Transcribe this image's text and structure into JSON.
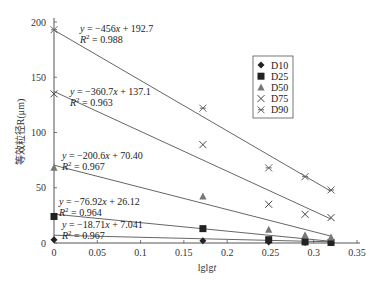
{
  "chart_data": {
    "type": "scatter",
    "title": "",
    "xlabel": "lglgt",
    "ylabel": "等效粒径R(μm)",
    "xlim": [
      0,
      0.35
    ],
    "ylim": [
      0,
      200
    ],
    "xticks": [
      0,
      0.05,
      0.1,
      0.15,
      0.2,
      0.25,
      0.3,
      0.35
    ],
    "xtick_labels": [
      "0",
      "0.05",
      "0.1",
      "0.15",
      "0.2",
      "0.25",
      "0.3",
      "0.35"
    ],
    "yticks": [
      0,
      50,
      100,
      150,
      200
    ],
    "ytick_labels": [
      "0",
      "50",
      "100",
      "150",
      "200"
    ],
    "grid": false,
    "legend_position": "upper right (inside)",
    "x": [
      0,
      0.172,
      0.248,
      0.29,
      0.32
    ],
    "series": [
      {
        "name": "D10",
        "marker": "diamond",
        "values": [
          3,
          2,
          1,
          0.5,
          0.3
        ],
        "fit": {
          "slope": -18.71,
          "intercept": 7.041,
          "equation": "y = −18.71x + 7.041",
          "r2": "R² = 0.967"
        }
      },
      {
        "name": "D25",
        "marker": "square",
        "values": [
          24,
          13,
          3,
          1,
          0.5
        ],
        "fit": {
          "slope": -76.92,
          "intercept": 26.12,
          "equation": "y = −76.92x + 26.12",
          "r2": "R² = 0.964"
        }
      },
      {
        "name": "D50",
        "marker": "triangle",
        "values": [
          68,
          42,
          12,
          7,
          5
        ],
        "fit": {
          "slope": -200.6,
          "intercept": 70.4,
          "equation": "y = −200.6x + 70.40",
          "r2": "R² = 0.967"
        }
      },
      {
        "name": "D75",
        "marker": "x",
        "values": [
          135,
          89,
          35,
          26,
          23
        ],
        "fit": {
          "slope": -360.7,
          "intercept": 137.1,
          "equation": "y = −360.7x + 137.1",
          "r2": "R² = 0.963"
        }
      },
      {
        "name": "D90",
        "marker": "star",
        "values": [
          193,
          122,
          68,
          60,
          48
        ],
        "fit": {
          "slope": -456,
          "intercept": 192.7,
          "equation": "y = −456x + 192.7",
          "r2": "R² = 0.988"
        }
      }
    ],
    "annotations": [
      {
        "series": "D90",
        "line1": "y = −456x + 192.7",
        "line2": "R² = 0.988"
      },
      {
        "series": "D75",
        "line1": "y = −360.7x + 137.1",
        "line2": "R² = 0.963"
      },
      {
        "series": "D50",
        "line1": "y = −200.6x + 70.40",
        "line2": "R² = 0.967"
      },
      {
        "series": "D25",
        "line1": "y = −76.92x + 26.12",
        "line2": "R² = 0.964"
      },
      {
        "series": "D10",
        "line1": "y = −18.71x + 7.041",
        "line2": "R² = 0.967"
      }
    ]
  }
}
